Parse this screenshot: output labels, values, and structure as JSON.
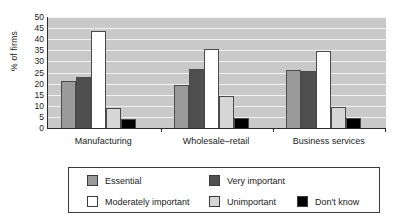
{
  "chart_data": {
    "type": "bar",
    "title": "",
    "xlabel": "",
    "ylabel": "% of firms",
    "ylim": [
      0,
      50
    ],
    "yticks": [
      0,
      5,
      10,
      15,
      20,
      25,
      30,
      35,
      40,
      45,
      50
    ],
    "grid": true,
    "legend_position": "bottom",
    "categories": [
      "Manufacturing",
      "Wholesale–retail",
      "Business services"
    ],
    "series": [
      {
        "name": "Essential",
        "color": "#9a9a9a",
        "values": [
          21.0,
          19.5,
          26.0
        ]
      },
      {
        "name": "Very important",
        "color": "#4f4f4f",
        "values": [
          23.2,
          26.6,
          25.5
        ]
      },
      {
        "name": "Moderately important",
        "color": "#ffffff",
        "values": [
          43.5,
          35.8,
          34.6
        ]
      },
      {
        "name": "Unimportant",
        "color": "#d6d6d6",
        "values": [
          9.2,
          14.4,
          9.6
        ]
      },
      {
        "name": "Don't know",
        "color": "#000000",
        "values": [
          4.0,
          4.4,
          4.3
        ]
      }
    ]
  },
  "axis": {
    "y_title": "% of firms",
    "tick_labels": [
      "50",
      "45",
      "40",
      "35",
      "30",
      "25",
      "20",
      "15",
      "10",
      "5",
      "0"
    ]
  },
  "categories": [
    {
      "label": "Manufacturing"
    },
    {
      "label": "Wholesale–retail"
    },
    {
      "label": "Business services"
    }
  ],
  "legend": {
    "row1": [
      {
        "label": "Essential",
        "color": "#9a9a9a"
      },
      {
        "label": "Very important",
        "color": "#4f4f4f"
      }
    ],
    "row2": [
      {
        "label": "Moderately important",
        "color": "#ffffff"
      },
      {
        "label": "Unimportant",
        "color": "#d6d6d6"
      },
      {
        "label": "Don't know",
        "color": "#000000"
      }
    ]
  },
  "colors": {
    "plot_background": "#c9c9c9",
    "gridline": "#f2f2f2",
    "axis": "#2b2b2b",
    "bar_border": "#4a4a4a",
    "legend_border": "#3a3a3a"
  }
}
